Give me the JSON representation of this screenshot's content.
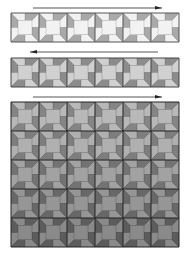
{
  "diagram": {
    "canvas": {
      "width": 190,
      "height": 260
    },
    "block_size": {
      "w": 28,
      "h": 29
    },
    "arrows": [
      {
        "id": "arrow-1",
        "direction": "right",
        "x1": 33,
        "x2": 162,
        "y": 8
      },
      {
        "id": "arrow-2",
        "direction": "left",
        "x1": 30,
        "x2": 158,
        "y": 52
      },
      {
        "id": "arrow-3",
        "direction": "right",
        "x1": 33,
        "x2": 162,
        "y": 97
      }
    ],
    "strips": [
      {
        "id": "strip-1",
        "x": 11,
        "y": 13,
        "cols": 6,
        "rows": 1,
        "colors": {
          "light": "#f2f2f2",
          "mid": "#c9c9c9",
          "dark": "#a9a9a9",
          "line": "#555555"
        }
      },
      {
        "id": "strip-2",
        "x": 11,
        "y": 58,
        "cols": 6,
        "rows": 1,
        "colors": {
          "light": "#d0d0d0",
          "mid": "#a8a8a8",
          "dark": "#8c8c8c",
          "line": "#444444"
        }
      }
    ],
    "grid": {
      "id": "assembled-grid",
      "x": 11,
      "y": 102,
      "cols": 6,
      "rows": 5,
      "row_colors": [
        {
          "light": "#b8b8b8",
          "mid": "#9a9a9a",
          "dark": "#858585"
        },
        {
          "light": "#b0b0b0",
          "mid": "#939393",
          "dark": "#7e7e7e"
        },
        {
          "light": "#a2a2a2",
          "mid": "#878787",
          "dark": "#737373"
        },
        {
          "light": "#969696",
          "mid": "#7c7c7c",
          "dark": "#686868"
        },
        {
          "light": "#8a8a8a",
          "mid": "#707070",
          "dark": "#5c5c5c"
        }
      ],
      "line": "#222222"
    },
    "arrow_color": "#555555",
    "arrowhead_color": "#222222"
  }
}
